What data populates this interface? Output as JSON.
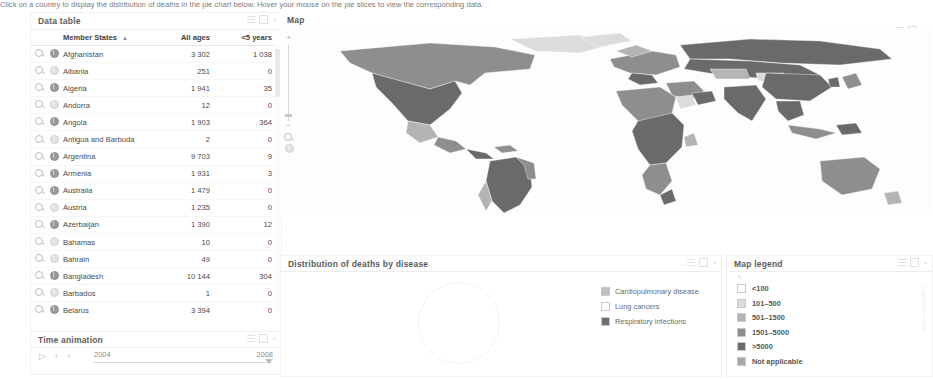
{
  "data_table": {
    "title": "Data table",
    "columns": [
      "Member States",
      "All ages",
      "<5 years"
    ],
    "sort_indicator": "▲",
    "rows": [
      {
        "name": "Afghanistan",
        "all_ages": "3 302",
        "under5": "1 038",
        "selected": true
      },
      {
        "name": "Albania",
        "all_ages": "251",
        "under5": "0",
        "selected": false
      },
      {
        "name": "Algeria",
        "all_ages": "1 941",
        "under5": "35",
        "selected": true
      },
      {
        "name": "Andorra",
        "all_ages": "12",
        "under5": "0",
        "selected": false
      },
      {
        "name": "Angola",
        "all_ages": "1 903",
        "under5": "364",
        "selected": true
      },
      {
        "name": "Antigua and Barbuda",
        "all_ages": "2",
        "under5": "0",
        "selected": false
      },
      {
        "name": "Argentina",
        "all_ages": "9 703",
        "under5": "9",
        "selected": true
      },
      {
        "name": "Armenia",
        "all_ages": "1 931",
        "under5": "3",
        "selected": true
      },
      {
        "name": "Australia",
        "all_ages": "1 479",
        "under5": "0",
        "selected": true
      },
      {
        "name": "Austria",
        "all_ages": "1 235",
        "under5": "0",
        "selected": false
      },
      {
        "name": "Azerbaijan",
        "all_ages": "1 390",
        "under5": "12",
        "selected": true
      },
      {
        "name": "Bahamas",
        "all_ages": "10",
        "under5": "0",
        "selected": false
      },
      {
        "name": "Bahrain",
        "all_ages": "49",
        "under5": "0",
        "selected": false
      },
      {
        "name": "Bangladesh",
        "all_ages": "10 144",
        "under5": "304",
        "selected": true
      },
      {
        "name": "Barbados",
        "all_ages": "1",
        "under5": "0",
        "selected": false
      },
      {
        "name": "Belarus",
        "all_ages": "3 394",
        "under5": "0",
        "selected": true
      },
      {
        "name": "Belgium",
        "all_ages": "1 557",
        "under5": "0",
        "selected": true
      },
      {
        "name": "Belize",
        "all_ages": "13",
        "under5": "0",
        "selected": false
      },
      {
        "name": "Benin",
        "all_ages": "916",
        "under5": "123",
        "selected": true
      }
    ]
  },
  "time_animation": {
    "title": "Time animation",
    "play_label": "▷",
    "prev_label": "‹",
    "next_label": "›",
    "start_year": "2004",
    "end_year": "2008"
  },
  "map": {
    "title": "Map",
    "zoom_in_label": "+",
    "zoom_out_label": "−"
  },
  "hint": {
    "text": "Click on a country to display the distribution of deaths in the pie chart below. Hover your mouse on the pie slices to view the corresponding data."
  },
  "pie_panel": {
    "title": "Distribution of deaths by disease",
    "legend": [
      {
        "label": "Cardiopulmonary disease",
        "color": "#bfbfbf"
      },
      {
        "label": "Lung cancers",
        "color": "#ffffff"
      },
      {
        "label": "Respiratory infections",
        "color": "#6f6f6f"
      }
    ]
  },
  "map_legend": {
    "title": "Map legend",
    "side_text": "Legend of values",
    "items": [
      {
        "label": "<100",
        "color": "#ffffff"
      },
      {
        "label": "101–500",
        "color": "#dcdcdc"
      },
      {
        "label": "501–1500",
        "color": "#b4b4b4"
      },
      {
        "label": "1501–5000",
        "color": "#8e8e8e"
      },
      {
        "label": ">5000",
        "color": "#6a6a6a"
      },
      {
        "label": "Not applicable",
        "color": "#a8a8a8"
      }
    ]
  },
  "window_controls": {
    "menu": "menu-icon",
    "restore": "restore-icon",
    "close": "×"
  }
}
